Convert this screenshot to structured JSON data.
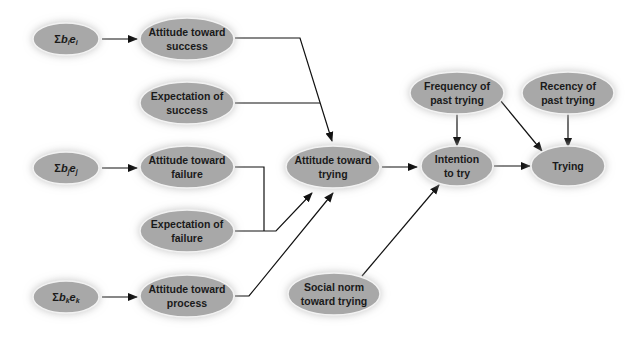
{
  "diagram": {
    "colors": {
      "node_fill": "#a8a8a8",
      "node_stroke": "#f2f2f2",
      "glow": "#d0d0d0",
      "edge": "#111111",
      "background": "#ffffff"
    },
    "nodes": {
      "sum_i": {
        "sigma": "Σ",
        "b": "b",
        "b_sub": "i",
        "e": "e",
        "e_sub": "i"
      },
      "sum_j": {
        "sigma": "Σ",
        "b": "b",
        "b_sub": "j",
        "e": "e",
        "e_sub": "j"
      },
      "sum_k": {
        "sigma": "Σ",
        "b": "b",
        "b_sub": "k",
        "e": "e",
        "e_sub": "k"
      },
      "attitude_success": {
        "line1": "Attitude toward",
        "line2": "success"
      },
      "expectation_success": {
        "line1": "Expectation of",
        "line2": "success"
      },
      "attitude_failure": {
        "line1": "Attitude toward",
        "line2": "failure"
      },
      "expectation_failure": {
        "line1": "Expectation of",
        "line2": "failure"
      },
      "attitude_process": {
        "line1": "Attitude toward",
        "line2": "process"
      },
      "attitude_trying": {
        "line1": "Attitude toward",
        "line2": "trying"
      },
      "social_norm": {
        "line1": "Social norm",
        "line2": "toward trying"
      },
      "frequency_past": {
        "line1": "Frequency of",
        "line2": "past trying"
      },
      "recency_past": {
        "line1": "Recency of",
        "line2": "past trying"
      },
      "intention": {
        "line1": "Intention",
        "line2": "to try"
      },
      "trying": {
        "line1": "Trying"
      }
    },
    "edges": [
      {
        "from": "sum_i",
        "to": "attitude_success"
      },
      {
        "from": "sum_j",
        "to": "attitude_failure"
      },
      {
        "from": "sum_k",
        "to": "attitude_process"
      },
      {
        "from": "attitude_success",
        "to": "attitude_trying",
        "joined_with": "expectation_success"
      },
      {
        "from": "expectation_success",
        "to": "attitude_trying",
        "joined_with": "attitude_success"
      },
      {
        "from": "attitude_failure",
        "to": "attitude_trying",
        "joined_with": "expectation_failure"
      },
      {
        "from": "expectation_failure",
        "to": "attitude_trying",
        "joined_with": "attitude_failure"
      },
      {
        "from": "attitude_process",
        "to": "attitude_trying"
      },
      {
        "from": "attitude_trying",
        "to": "intention"
      },
      {
        "from": "social_norm",
        "to": "intention"
      },
      {
        "from": "frequency_past",
        "to": "intention"
      },
      {
        "from": "frequency_past",
        "to": "trying"
      },
      {
        "from": "recency_past",
        "to": "trying"
      },
      {
        "from": "intention",
        "to": "trying"
      }
    ]
  }
}
